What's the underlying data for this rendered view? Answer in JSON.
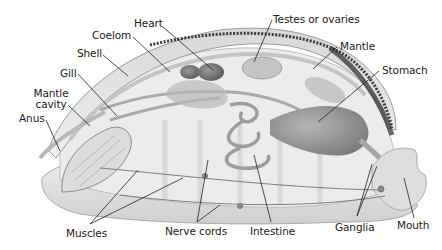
{
  "diagram": {
    "colors": {
      "background": "#ffffff",
      "body_light": "#e6e6e6",
      "body_mid": "#bdbdbd",
      "organ_dark": "#6e6e6e",
      "shell_edge": "#3a3a3a",
      "leader_line": "#222222",
      "label_text": "#1a1a1a"
    },
    "labels": {
      "heart": "Heart",
      "coelom": "Coelom",
      "shell": "Shell",
      "gill": "Gill",
      "mantle_cavity_line1": "Mantle",
      "mantle_cavity_line2": "cavity",
      "anus": "Anus",
      "testes_or_ovaries": "Testes or ovaries",
      "mantle": "Mantle",
      "stomach": "Stomach",
      "muscles": "Muscles",
      "nerve_cords": "Nerve cords",
      "intestine": "Intestine",
      "ganglia": "Ganglia",
      "mouth": "Mouth"
    }
  }
}
